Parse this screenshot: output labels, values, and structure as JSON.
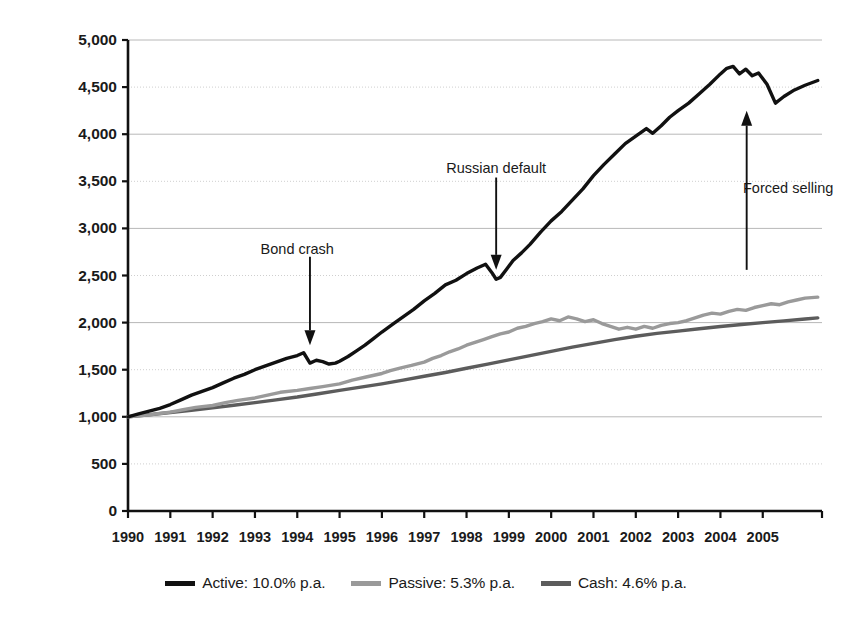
{
  "chart_data": {
    "type": "line",
    "title": "",
    "xlabel": "",
    "ylabel": "Cumulative performance (1.1.1990 = 1,000)",
    "xlim": [
      1990,
      2006.4
    ],
    "ylim": [
      0,
      5000
    ],
    "grid": true,
    "y_ticks": [
      0,
      500,
      1000,
      1500,
      2000,
      2500,
      3000,
      3500,
      4000,
      4500,
      5000
    ],
    "y_tick_labels": [
      "0",
      "500",
      "1,000",
      "1,500",
      "2,000",
      "2,500",
      "3,000",
      "3,500",
      "4,000",
      "4,500",
      "5,000"
    ],
    "x_ticks": [
      1990,
      1991,
      1992,
      1993,
      1994,
      1995,
      1996,
      1997,
      1998,
      1999,
      2000,
      2001,
      2002,
      2003,
      2004,
      2005
    ],
    "x_tick_labels": [
      "1990",
      "1991",
      "1992",
      "1993",
      "1994",
      "1995",
      "1996",
      "1997",
      "1998",
      "1999",
      "2000",
      "2001",
      "2002",
      "2003",
      "2004",
      "2005"
    ],
    "legend_position": "bottom",
    "series": [
      {
        "name": "Active: 10.0% p.a.",
        "short_name": "Active",
        "cagr_pct": 10.0,
        "color": "#111111",
        "width": 3.4,
        "x": [
          1990.0,
          1990.25,
          1990.5,
          1990.75,
          1991.0,
          1991.25,
          1991.5,
          1991.75,
          1992.0,
          1992.25,
          1992.5,
          1992.75,
          1993.0,
          1993.25,
          1993.5,
          1993.75,
          1994.0,
          1994.15,
          1994.3,
          1994.45,
          1994.6,
          1994.75,
          1994.9,
          1995.0,
          1995.2,
          1995.4,
          1995.6,
          1995.8,
          1996.0,
          1996.25,
          1996.5,
          1996.75,
          1997.0,
          1997.25,
          1997.5,
          1997.75,
          1998.0,
          1998.25,
          1998.45,
          1998.6,
          1998.7,
          1998.8,
          1998.95,
          1999.1,
          1999.3,
          1999.5,
          1999.75,
          2000.0,
          2000.25,
          2000.5,
          2000.75,
          2001.0,
          2001.25,
          2001.5,
          2001.75,
          2002.0,
          2002.25,
          2002.4,
          2002.6,
          2002.8,
          2003.0,
          2003.25,
          2003.5,
          2003.75,
          2004.0,
          2004.15,
          2004.3,
          2004.45,
          2004.6,
          2004.75,
          2004.9,
          2005.1,
          2005.3,
          2005.5,
          2005.75,
          2006.0,
          2006.3
        ],
        "y": [
          1000,
          1030,
          1060,
          1090,
          1130,
          1180,
          1230,
          1270,
          1310,
          1360,
          1410,
          1450,
          1500,
          1540,
          1580,
          1620,
          1650,
          1680,
          1570,
          1600,
          1585,
          1560,
          1570,
          1590,
          1640,
          1700,
          1760,
          1830,
          1900,
          1980,
          2060,
          2140,
          2230,
          2310,
          2400,
          2450,
          2520,
          2580,
          2620,
          2530,
          2460,
          2480,
          2570,
          2660,
          2740,
          2830,
          2960,
          3080,
          3180,
          3300,
          3420,
          3560,
          3680,
          3790,
          3900,
          3980,
          4060,
          4010,
          4090,
          4180,
          4250,
          4330,
          4430,
          4530,
          4640,
          4700,
          4720,
          4640,
          4690,
          4620,
          4650,
          4530,
          4330,
          4400,
          4470,
          4520,
          4570
        ]
      },
      {
        "name": "Passive: 5.3% p.a.",
        "short_name": "Passive",
        "cagr_pct": 5.3,
        "color": "#9a9a9a",
        "width": 3.4,
        "x": [
          1990.0,
          1990.25,
          1990.5,
          1990.75,
          1991.0,
          1991.3,
          1991.6,
          1992.0,
          1992.3,
          1992.6,
          1993.0,
          1993.3,
          1993.6,
          1994.0,
          1994.3,
          1994.6,
          1995.0,
          1995.3,
          1995.6,
          1996.0,
          1996.2,
          1996.45,
          1996.7,
          1997.0,
          1997.2,
          1997.4,
          1997.6,
          1997.8,
          1998.0,
          1998.2,
          1998.4,
          1998.6,
          1998.8,
          1999.0,
          1999.2,
          1999.4,
          1999.6,
          1999.8,
          2000.0,
          2000.2,
          2000.4,
          2000.6,
          2000.8,
          2001.0,
          2001.2,
          2001.4,
          2001.6,
          2001.8,
          2002.0,
          2002.2,
          2002.4,
          2002.6,
          2002.8,
          2003.0,
          2003.2,
          2003.4,
          2003.6,
          2003.8,
          2004.0,
          2004.2,
          2004.4,
          2004.6,
          2004.8,
          2005.0,
          2005.2,
          2005.4,
          2005.6,
          2005.8,
          2006.0,
          2006.3
        ],
        "y": [
          1000,
          1010,
          1020,
          1035,
          1050,
          1075,
          1100,
          1120,
          1150,
          1175,
          1200,
          1230,
          1260,
          1280,
          1300,
          1320,
          1350,
          1390,
          1420,
          1460,
          1490,
          1520,
          1545,
          1580,
          1620,
          1650,
          1690,
          1720,
          1760,
          1790,
          1820,
          1850,
          1880,
          1900,
          1940,
          1960,
          1990,
          2010,
          2040,
          2020,
          2060,
          2040,
          2010,
          2030,
          1990,
          1960,
          1930,
          1950,
          1930,
          1960,
          1940,
          1970,
          1990,
          2000,
          2020,
          2050,
          2080,
          2100,
          2090,
          2120,
          2140,
          2130,
          2160,
          2180,
          2200,
          2190,
          2220,
          2240,
          2260,
          2270
        ]
      },
      {
        "name": "Cash: 4.6% p.a.",
        "short_name": "Cash",
        "cagr_pct": 4.6,
        "color": "#5c5c5c",
        "width": 3.4,
        "x": [
          1990.0,
          1990.5,
          1991.0,
          1991.5,
          1992.0,
          1992.5,
          1993.0,
          1993.5,
          1994.0,
          1994.5,
          1995.0,
          1995.5,
          1996.0,
          1996.5,
          1997.0,
          1997.5,
          1998.0,
          1998.5,
          1999.0,
          1999.5,
          2000.0,
          2000.5,
          2001.0,
          2001.5,
          2002.0,
          2002.5,
          2003.0,
          2003.5,
          2004.0,
          2004.5,
          2005.0,
          2005.5,
          2006.0,
          2006.3
        ],
        "y": [
          1000,
          1022,
          1045,
          1070,
          1095,
          1122,
          1150,
          1180,
          1210,
          1245,
          1280,
          1315,
          1350,
          1390,
          1430,
          1470,
          1515,
          1560,
          1605,
          1650,
          1695,
          1740,
          1780,
          1820,
          1855,
          1885,
          1910,
          1935,
          1958,
          1980,
          2000,
          2018,
          2038,
          2050
        ]
      }
    ],
    "annotations": [
      {
        "text": "Bond crash",
        "label_x": 1994.0,
        "label_y": 2780,
        "arrow_from_x": 1994.3,
        "arrow_from_y": 2700,
        "arrow_to_x": 1994.3,
        "arrow_to_y": 1760,
        "direction": "down"
      },
      {
        "text": "Russian default",
        "label_x": 1998.7,
        "label_y": 3640,
        "arrow_from_x": 1998.7,
        "arrow_from_y": 3540,
        "arrow_to_x": 1998.7,
        "arrow_to_y": 2560,
        "direction": "down"
      },
      {
        "text": "Forced selling",
        "label_x": 2005.6,
        "label_y": 3430,
        "arrow_from_x": 2004.62,
        "arrow_from_y": 2560,
        "arrow_to_x": 2004.62,
        "arrow_to_y": 4250,
        "direction": "up"
      }
    ]
  },
  "legend": {
    "items": [
      {
        "label": "Active: 10.0% p.a.",
        "color": "#111111"
      },
      {
        "label": "Passive: 5.3% p.a.",
        "color": "#9a9a9a"
      },
      {
        "label": "Cash: 4.6% p.a.",
        "color": "#5c5c5c"
      }
    ]
  },
  "axis": {
    "ylabel": "Cumulative performance (1.1.1990 = 1,000)"
  }
}
